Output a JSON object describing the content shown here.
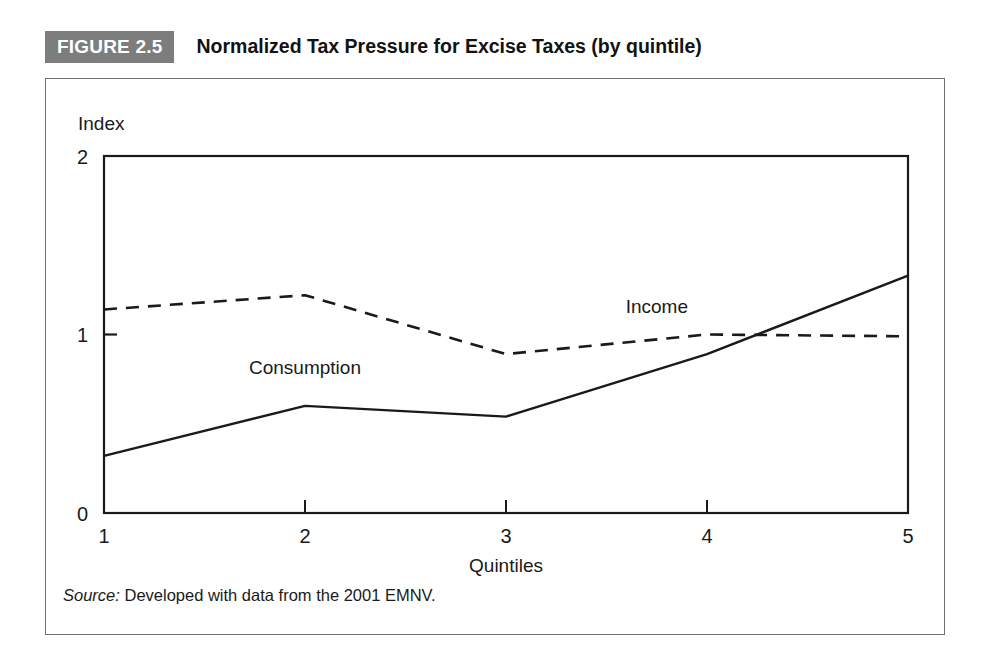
{
  "figure": {
    "badge_label": "FIGURE 2.5",
    "title": "Normalized Tax Pressure for Excise Taxes (by quintile)",
    "source_keyword": "Source:",
    "source_text": " Developed with data from the 2001 EMNV.",
    "badge_color": "#7d7d7d",
    "frame_color": "#6f6f6f",
    "line_color": "#1a1a1a"
  },
  "chart_data": {
    "type": "line",
    "title": "Normalized Tax Pressure for Excise Taxes (by quintile)",
    "xlabel": "Quintiles",
    "ylabel": "Index",
    "x": [
      1,
      2,
      3,
      4,
      5
    ],
    "categories": [
      "1",
      "2",
      "3",
      "4",
      "5"
    ],
    "xtick_labels": [
      "1",
      "2",
      "3",
      "4",
      "5"
    ],
    "ytick_labels": [
      "0",
      "1",
      "2"
    ],
    "yticks": [
      0,
      1,
      2
    ],
    "xlim": [
      1,
      5
    ],
    "ylim": [
      0,
      2
    ],
    "grid": false,
    "legend_position": "inline-annotations",
    "series": [
      {
        "name": "Consumption",
        "style": "solid",
        "values": [
          0.32,
          0.6,
          0.54,
          0.89,
          1.33
        ],
        "label_x": 2.0,
        "label_y": 0.78
      },
      {
        "name": "Income",
        "style": "dashed",
        "values": [
          1.14,
          1.22,
          0.89,
          1.0,
          0.99
        ],
        "label_x": 3.75,
        "label_y": 1.12
      }
    ],
    "annotations": [
      "Consumption",
      "Income"
    ]
  }
}
